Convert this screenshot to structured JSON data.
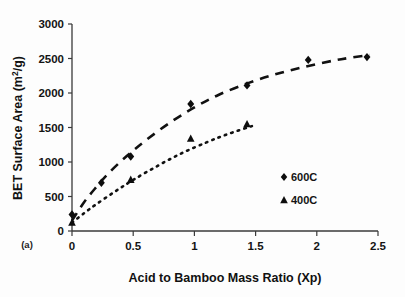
{
  "figure": {
    "panel_label": "(a)",
    "background": "#fdfdfd",
    "ink_color": "#111111"
  },
  "chart_data": {
    "type": "scatter",
    "title": "",
    "subtitle": "",
    "xlabel": "Acid to Bamboo Mass Ratio (Xp)",
    "ylabel": "BET Surface Area (m2/g)",
    "ylabel_base": "BET Surface Area (m",
    "ylabel_sup": "2",
    "ylabel_tail": "/g)",
    "xlim": [
      0,
      2.5
    ],
    "ylim": [
      0,
      3000
    ],
    "xticks": [
      0,
      0.5,
      1,
      1.5,
      2,
      2.5
    ],
    "xtick_labels": [
      "0",
      "0.5",
      "1",
      "1.5",
      "2",
      "2.5"
    ],
    "yticks": [
      0,
      500,
      1000,
      1500,
      2000,
      2500,
      3000
    ],
    "ytick_labels": [
      "0",
      "500",
      "1000",
      "1500",
      "2000",
      "2500",
      "3000"
    ],
    "grid": false,
    "legend_position": "inside-right",
    "series": [
      {
        "name": "600C",
        "marker": "diamond",
        "fit_style": "dashed",
        "color": "#111111",
        "points": [
          {
            "x": 0.0,
            "y": 240
          },
          {
            "x": 0.24,
            "y": 700
          },
          {
            "x": 0.48,
            "y": 1080
          },
          {
            "x": 0.97,
            "y": 1840
          },
          {
            "x": 1.43,
            "y": 2110
          },
          {
            "x": 1.93,
            "y": 2480
          },
          {
            "x": 2.41,
            "y": 2520
          }
        ],
        "fit_curve": [
          {
            "x": 0.0,
            "y": 150
          },
          {
            "x": 0.1,
            "y": 420
          },
          {
            "x": 0.2,
            "y": 640
          },
          {
            "x": 0.3,
            "y": 840
          },
          {
            "x": 0.45,
            "y": 1090
          },
          {
            "x": 0.6,
            "y": 1310
          },
          {
            "x": 0.8,
            "y": 1570
          },
          {
            "x": 1.0,
            "y": 1790
          },
          {
            "x": 1.2,
            "y": 1975
          },
          {
            "x": 1.45,
            "y": 2150
          },
          {
            "x": 1.7,
            "y": 2290
          },
          {
            "x": 1.95,
            "y": 2400
          },
          {
            "x": 2.2,
            "y": 2490
          },
          {
            "x": 2.43,
            "y": 2550
          }
        ]
      },
      {
        "name": "400C",
        "marker": "triangle",
        "fit_style": "dotted",
        "color": "#111111",
        "points": [
          {
            "x": 0.0,
            "y": 125
          },
          {
            "x": 0.48,
            "y": 745
          },
          {
            "x": 0.97,
            "y": 1340
          },
          {
            "x": 1.43,
            "y": 1550
          }
        ],
        "fit_curve": [
          {
            "x": 0.0,
            "y": 120
          },
          {
            "x": 0.1,
            "y": 260
          },
          {
            "x": 0.2,
            "y": 390
          },
          {
            "x": 0.35,
            "y": 570
          },
          {
            "x": 0.5,
            "y": 740
          },
          {
            "x": 0.7,
            "y": 945
          },
          {
            "x": 0.9,
            "y": 1130
          },
          {
            "x": 1.1,
            "y": 1285
          },
          {
            "x": 1.25,
            "y": 1390
          },
          {
            "x": 1.4,
            "y": 1480
          },
          {
            "x": 1.47,
            "y": 1520
          }
        ]
      }
    ],
    "legend": [
      {
        "label": "600C",
        "marker": "diamond"
      },
      {
        "label": "400C",
        "marker": "triangle"
      }
    ]
  }
}
